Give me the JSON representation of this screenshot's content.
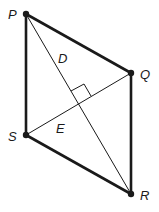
{
  "diagram": {
    "type": "geometry",
    "shape": "parallelogram",
    "vertices": {
      "P": {
        "label": "P",
        "x": 26,
        "y": 14
      },
      "Q": {
        "label": "Q",
        "x": 131,
        "y": 73
      },
      "R": {
        "label": "R",
        "x": 131,
        "y": 194
      },
      "S": {
        "label": "S",
        "x": 26,
        "y": 135
      }
    },
    "diagonals": [
      {
        "from": "P",
        "to": "R"
      },
      {
        "from": "S",
        "to": "Q"
      }
    ],
    "points": {
      "D": {
        "label": "D"
      },
      "E": {
        "label": "E"
      }
    },
    "right_angle_marker": true,
    "colors": {
      "stroke": "#1a1a1a",
      "background": "#ffffff"
    }
  }
}
